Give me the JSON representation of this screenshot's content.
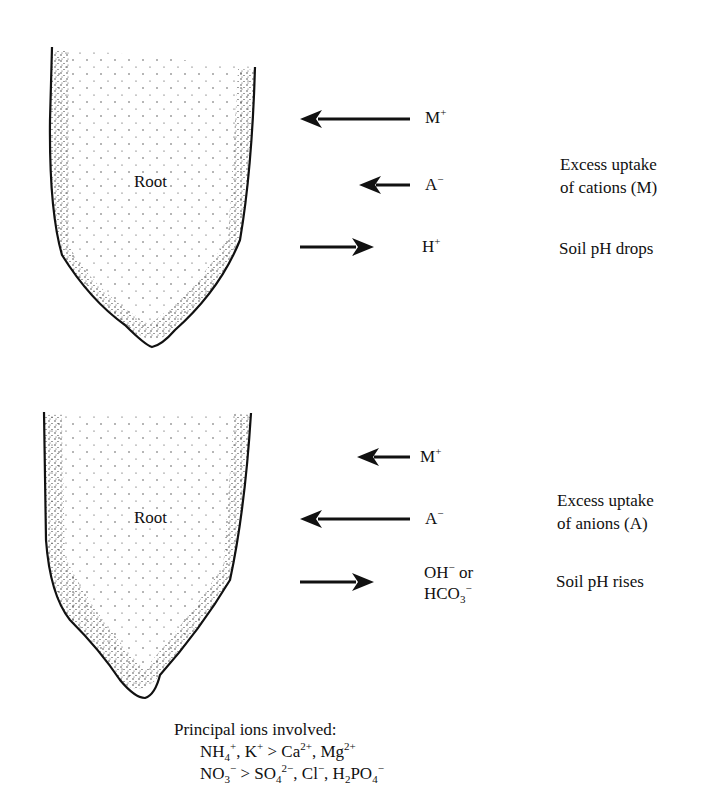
{
  "panels": [
    {
      "id": "cations",
      "root_label": "Root",
      "arrows": [
        {
          "ion": "M",
          "charge": "+",
          "direction": "into-root",
          "length": "long"
        },
        {
          "ion": "A",
          "charge": "−",
          "direction": "into-root",
          "length": "short"
        },
        {
          "ion": "H",
          "charge": "+",
          "direction": "out-of-root",
          "length": "medium"
        }
      ],
      "explanation_line1": "Excess uptake",
      "explanation_line2": "of cations (M)",
      "result": "Soil pH drops"
    },
    {
      "id": "anions",
      "root_label": "Root",
      "arrows": [
        {
          "ion": "M",
          "charge": "+",
          "direction": "into-root",
          "length": "short"
        },
        {
          "ion": "A",
          "charge": "−",
          "direction": "into-root",
          "length": "long"
        },
        {
          "ion": "OH",
          "charge": "−",
          "suffix": " or",
          "ion2": "HCO",
          "ion2_sub": "3",
          "ion2_charge": "−",
          "direction": "out-of-root",
          "length": "medium"
        }
      ],
      "explanation_line1": "Excess uptake",
      "explanation_line2": "of anions (A)",
      "result": "Soil pH rises"
    }
  ],
  "footer": {
    "title": "Principal ions involved:",
    "cations_line": {
      "a": "NH",
      "a_sub": "4",
      "a_sup": "+",
      "b": ", K",
      "b_sup": "+",
      "gt": " > Ca",
      "c_sup": "2+",
      "d": ", Mg",
      "d_sup": "2+"
    },
    "anions_line": {
      "a": "NO",
      "a_sub": "3",
      "a_sup": "−",
      "gt": " > SO",
      "b_sub": "4",
      "b_sup": "2−",
      "c": ", Cl",
      "c_sup": "−",
      "d": ", H",
      "d_sub": "2",
      "e": "PO",
      "e_sub": "4",
      "e_sup": "−"
    }
  }
}
